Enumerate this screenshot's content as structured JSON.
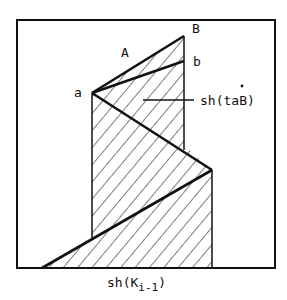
{
  "diagram": {
    "labels": {
      "B": "B",
      "A": "A",
      "b": "b",
      "a": "a",
      "region": "sh(taB)",
      "region_dot": "˙",
      "bottom_main": "sh(K",
      "bottom_sub": "i-1",
      "bottom_close": ")"
    },
    "colors": {
      "stroke": "#111111",
      "background": "#ffffff"
    }
  }
}
